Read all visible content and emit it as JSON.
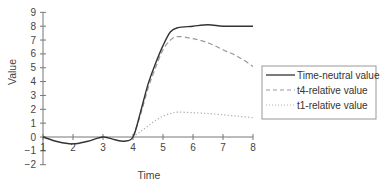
{
  "chart_data": {
    "type": "line",
    "title": "",
    "xlabel": "Time",
    "ylabel": "Value",
    "xlim": [
      1,
      8
    ],
    "ylim": [
      -2,
      9
    ],
    "x_ticks": [
      "1",
      "2",
      "3",
      "4",
      "5",
      "6",
      "7",
      "8"
    ],
    "y_ticks": [
      "−2",
      "−1",
      "0",
      "1",
      "2",
      "3",
      "4",
      "5",
      "6",
      "7",
      "8",
      "9"
    ],
    "grid": false,
    "legend_position": "right",
    "series": [
      {
        "name": "Time-neutral value",
        "style": "solid",
        "color": "#333333",
        "x": [
          1,
          1.5,
          2,
          2.5,
          3,
          3.4,
          3.7,
          4,
          4.25,
          4.5,
          4.75,
          5,
          5.25,
          5.5,
          6,
          6.5,
          7,
          7.5,
          8
        ],
        "y": [
          0,
          -0.35,
          -0.5,
          -0.3,
          0,
          -0.2,
          -0.3,
          0,
          1.8,
          3.8,
          5.3,
          6.6,
          7.6,
          7.9,
          8.0,
          8.1,
          8.0,
          8.0,
          8.0
        ]
      },
      {
        "name": "t4-relative value",
        "style": "dashed",
        "color": "#999999",
        "x": [
          4,
          4.25,
          4.5,
          4.75,
          5,
          5.25,
          5.5,
          6,
          6.5,
          7,
          7.5,
          8
        ],
        "y": [
          0,
          1.6,
          3.5,
          5.0,
          6.3,
          7.0,
          7.25,
          7.1,
          6.8,
          6.3,
          5.8,
          5.1
        ]
      },
      {
        "name": "t1-relative value",
        "style": "dotted",
        "color": "#aaaaaa",
        "x": [
          4,
          4.25,
          4.5,
          4.75,
          5,
          5.25,
          5.5,
          6,
          6.5,
          7,
          7.5,
          8
        ],
        "y": [
          0,
          0.4,
          0.8,
          1.2,
          1.5,
          1.7,
          1.8,
          1.75,
          1.7,
          1.6,
          1.5,
          1.4
        ]
      }
    ]
  },
  "axes": {
    "xlabel": "Time",
    "ylabel": "Value"
  },
  "legend": {
    "items": [
      {
        "label": "Time-neutral value",
        "style": "solid"
      },
      {
        "label": "t4-relative value",
        "style": "dashed"
      },
      {
        "label": "t1-relative value",
        "style": "dotted"
      }
    ]
  },
  "colors": {
    "axis": "#777777",
    "solid_line": "#333333",
    "dashed_line": "#999999",
    "dotted_line": "#aaaaaa",
    "legend_border": "#999999"
  }
}
